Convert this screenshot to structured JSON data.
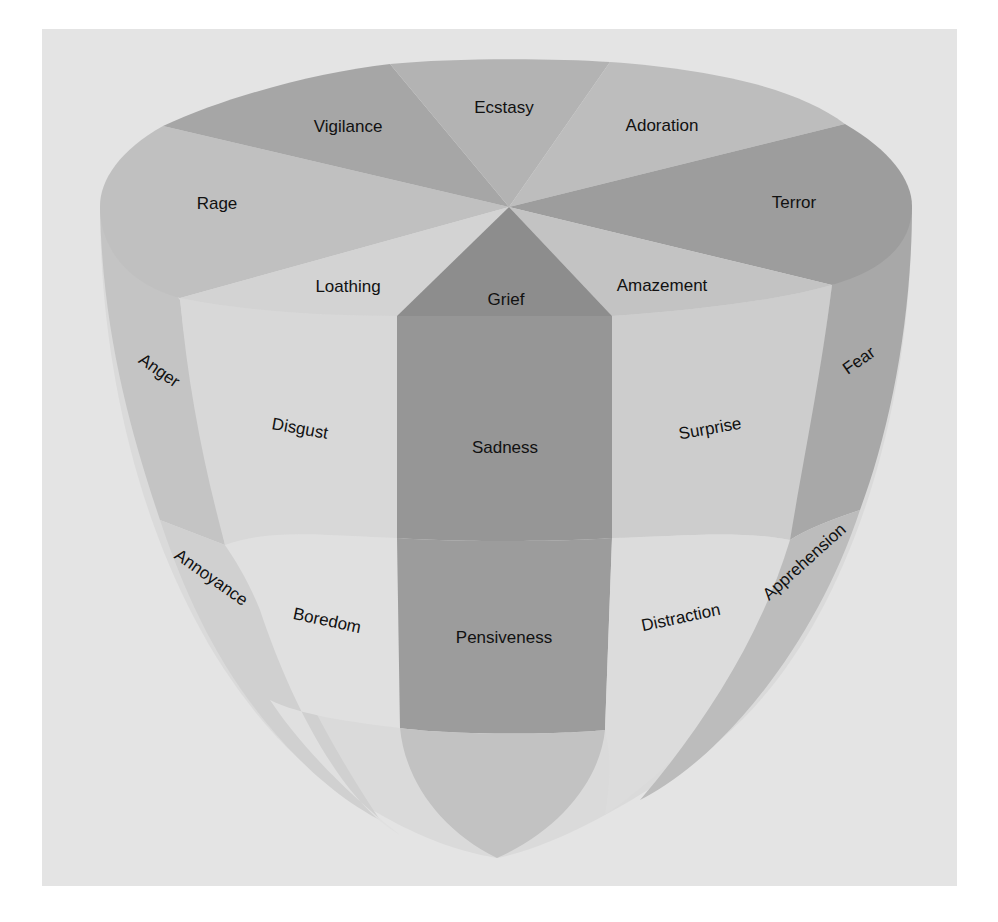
{
  "diagram": {
    "type": "emotion-cone",
    "colors": {
      "panel_bg": "#e4e4e4",
      "darkest": "#8f8f8f",
      "dark": "#a2a2a2",
      "mid": "#b4b4b4",
      "light": "#c6c6c6",
      "lighter": "#d6d6d6",
      "lightest": "#dedede",
      "text": "#111111"
    },
    "top_face": {
      "vigilance": "Vigilance",
      "ecstasy": "Ecstasy",
      "adoration": "Adoration",
      "terror": "Terror",
      "rage": "Rage",
      "loathing": "Loathing",
      "grief": "Grief",
      "amazement": "Amazement"
    },
    "middle_band": {
      "anger": "Anger",
      "disgust": "Disgust",
      "sadness": "Sadness",
      "surprise": "Surprise",
      "fear": "Fear"
    },
    "lower_band": {
      "annoyance": "Annoyance",
      "boredom": "Boredom",
      "pensiveness": "Pensiveness",
      "distraction": "Distraction",
      "apprehension": "Apprehension"
    }
  }
}
